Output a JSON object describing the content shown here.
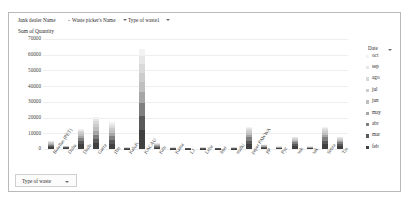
{
  "window": {
    "background": "#ffffff",
    "border_color": "#b9b9b9"
  },
  "field_bar": {
    "fields": [
      {
        "label": "Junk dealer Name",
        "has_dropdown": false,
        "has_filter_icon": false,
        "x": 9
      },
      {
        "label": "Waste picker's Name",
        "has_dropdown": true,
        "has_filter_icon": true,
        "x": 63
      },
      {
        "label": "Type of waste1",
        "has_dropdown": true,
        "has_filter_icon": false,
        "x": 119
      }
    ],
    "filter_icon_name": "funnel-icon",
    "dropdown_icon_name": "chevron-down-icon"
  },
  "chart_title": "Sum of Quantity",
  "legend": {
    "title": "Date",
    "has_dropdown": true,
    "entries": [
      {
        "label": "oct",
        "color": "#f2f2f2"
      },
      {
        "label": "sep",
        "color": "#e6e6e6"
      },
      {
        "label": "ago",
        "color": "#d9d9d9"
      },
      {
        "label": "jul",
        "color": "#cccccc"
      },
      {
        "label": "jun",
        "color": "#bfbfbf"
      },
      {
        "label": "may",
        "color": "#a6a6a6"
      },
      {
        "label": "abr",
        "color": "#7f7f7f"
      },
      {
        "label": "mar",
        "color": "#595959"
      },
      {
        "label": "feb",
        "color": "#404040"
      }
    ]
  },
  "slicer": {
    "label": "Type of waste",
    "has_dropdown": true
  },
  "chart_data": {
    "type": "bar",
    "stacked": true,
    "title": "Sum of Quantity",
    "xlabel": "",
    "ylabel": "",
    "ylim": [
      0,
      70000
    ],
    "yticks": [
      0,
      10000,
      20000,
      30000,
      40000,
      50000,
      60000,
      70000
    ],
    "ytick_labels": [
      "0",
      "10000",
      "20000",
      "30000",
      "40000",
      "50000",
      "60000",
      "70000"
    ],
    "grid": true,
    "legend_position": "right",
    "legend_title": "Date",
    "series_names": [
      "feb",
      "mar",
      "abr",
      "may",
      "jun",
      "jul",
      "ago",
      "sep",
      "oct"
    ],
    "series_colors": [
      "#404040",
      "#595959",
      "#7f7f7f",
      "#a6a6a6",
      "#bfbfbf",
      "#cccccc",
      "#d9d9d9",
      "#e6e6e6",
      "#f2f2f2"
    ],
    "categories": [
      "Botellas (PET)",
      "Duha",
      "Dudb",
      "Garra",
      "Hm",
      "KaluK",
      "KACAU",
      "Kdn",
      "Kama",
      "LJ",
      "Lcba",
      "Met",
      "malki",
      "paper PAWWA",
      "PP",
      "Pyc",
      "suk",
      "sak",
      "Sebra",
      "Tin"
    ],
    "series": [
      {
        "name": "feb",
        "values": [
          1200,
          600,
          3000,
          3600,
          3200,
          300,
          12000,
          900,
          300,
          200,
          300,
          200,
          300,
          3000,
          700,
          400,
          1800,
          400,
          3000,
          1800
        ]
      },
      {
        "name": "mar",
        "values": [
          900,
          400,
          2200,
          3000,
          2600,
          200,
          9000,
          700,
          200,
          150,
          200,
          150,
          200,
          2400,
          500,
          300,
          1400,
          300,
          2400,
          1400
        ]
      },
      {
        "name": "abr",
        "values": [
          700,
          300,
          1800,
          2600,
          2200,
          150,
          8000,
          500,
          150,
          120,
          150,
          120,
          150,
          2000,
          400,
          250,
          1100,
          250,
          2000,
          1100
        ]
      },
      {
        "name": "may",
        "values": [
          600,
          250,
          1500,
          2400,
          2000,
          120,
          7000,
          400,
          120,
          100,
          120,
          100,
          120,
          1700,
          350,
          200,
          900,
          200,
          1700,
          900
        ]
      },
      {
        "name": "jun",
        "values": [
          500,
          200,
          1200,
          2200,
          1800,
          100,
          6500,
          350,
          100,
          80,
          100,
          80,
          100,
          1400,
          300,
          180,
          700,
          180,
          1400,
          700
        ]
      },
      {
        "name": "jul",
        "values": [
          400,
          150,
          1000,
          2000,
          1600,
          80,
          6000,
          300,
          80,
          60,
          80,
          60,
          80,
          1200,
          250,
          150,
          600,
          150,
          1200,
          600
        ]
      },
      {
        "name": "ago",
        "values": [
          300,
          120,
          800,
          1800,
          1400,
          60,
          5500,
          250,
          60,
          50,
          60,
          50,
          60,
          1000,
          200,
          120,
          500,
          120,
          1000,
          500
        ]
      },
      {
        "name": "sep",
        "values": [
          250,
          100,
          600,
          1600,
          1200,
          50,
          5000,
          200,
          50,
          40,
          50,
          40,
          50,
          800,
          150,
          100,
          400,
          100,
          800,
          400
        ]
      },
      {
        "name": "oct",
        "values": [
          200,
          80,
          400,
          1400,
          1000,
          40,
          5000,
          150,
          40,
          30,
          40,
          30,
          40,
          600,
          100,
          80,
          300,
          80,
          600,
          300
        ]
      }
    ],
    "totals": [
      5050,
      2200,
      12500,
      20600,
      17000,
      1100,
      64000,
      3750,
      1100,
      830,
      1100,
      830,
      1100,
      14100,
      2950,
      1780,
      7700,
      1780,
      14100,
      7700
    ]
  }
}
